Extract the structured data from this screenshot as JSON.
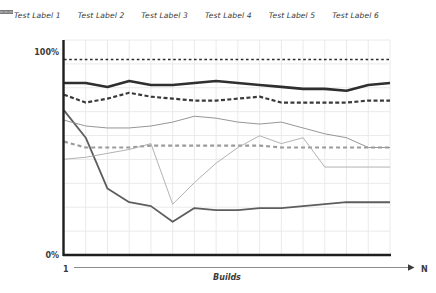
{
  "chart_data": {
    "type": "line",
    "title": "",
    "xlabel": "Builds",
    "ylabel": "",
    "x_axis_start_label": "1",
    "x_axis_end_label": "N",
    "ytick_labels": [
      "0%",
      "100%"
    ],
    "ylim": [
      0,
      110
    ],
    "xlim": [
      0,
      15
    ],
    "grid": true,
    "legend_position": "top",
    "x": [
      0,
      1,
      2,
      3,
      4,
      5,
      6,
      7,
      8,
      9,
      10,
      11,
      12,
      13,
      14,
      15
    ],
    "series": [
      {
        "name": "Test Label 1",
        "style": "solid",
        "width": 2.6,
        "color": "#2f2f2f",
        "values": [
          88,
          88,
          86,
          89,
          87,
          87,
          88,
          89,
          88,
          87,
          86,
          85,
          85,
          84,
          87,
          88
        ]
      },
      {
        "name": "Test Label 2",
        "style": "dashed",
        "width": 2.2,
        "color": "#3a3a3a",
        "values": [
          82,
          78,
          80,
          83,
          81,
          80,
          79,
          79,
          80,
          81,
          78,
          78,
          78,
          78,
          79,
          79
        ]
      },
      {
        "name": "Test Label 3",
        "style": "solid",
        "width": 1.8,
        "color": "#5d5d5d",
        "values": [
          74,
          60,
          34,
          27,
          25,
          17,
          24,
          23,
          23,
          24,
          24,
          25,
          26,
          27,
          27,
          27
        ]
      },
      {
        "name": "Test Label 4",
        "style": "solid",
        "width": 0.9,
        "color": "#8a8a8a",
        "values": [
          69,
          66,
          65,
          65,
          66,
          68,
          71,
          70,
          68,
          67,
          68,
          65,
          62,
          60,
          55,
          55
        ]
      },
      {
        "name": "Test Label 5",
        "style": "dashed",
        "width": 2.2,
        "color": "#9b9b9b",
        "values": [
          58,
          55,
          55,
          55,
          56,
          56,
          56,
          56,
          56,
          56,
          55,
          55,
          55,
          55,
          55,
          55
        ]
      },
      {
        "name": "Test Label 6",
        "style": "solid",
        "width": 0.9,
        "color": "#a9a9a9",
        "values": [
          49,
          50,
          52,
          54,
          57,
          26,
          37,
          47,
          55,
          61,
          57,
          60,
          45,
          45,
          45,
          45
        ]
      }
    ]
  },
  "legend": {
    "items": [
      {
        "label": "Test Label 1"
      },
      {
        "label": "Test Label 2"
      },
      {
        "label": "Test Label 3"
      },
      {
        "label": "Test Label 4"
      },
      {
        "label": "Test Label 5"
      },
      {
        "label": "Test Label 6"
      }
    ]
  }
}
